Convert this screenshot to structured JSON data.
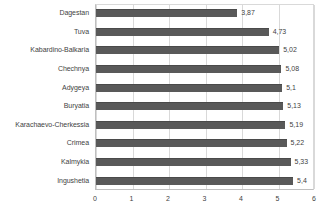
{
  "chart_data": {
    "type": "bar",
    "orientation": "horizontal",
    "title": "",
    "xlabel": "",
    "ylabel": "",
    "xlim": [
      0,
      6
    ],
    "xticks": [
      "0",
      "1",
      "2",
      "3",
      "4",
      "5",
      "6"
    ],
    "grid": true,
    "legend": "none",
    "decimal_separator": ",",
    "bar_color": "#595959",
    "gridline_color": "#d9d9d9",
    "categories": [
      "Dagestan",
      "Tuva",
      "Kabardino-Balkaria",
      "Chechnya",
      "Adygeya",
      "Buryatia",
      "Karachaevo-Cherkessia",
      "Crimea",
      "Kalmykia",
      "Ingushetia"
    ],
    "values": [
      3.87,
      4.73,
      5.02,
      5.08,
      5.1,
      5.13,
      5.19,
      5.22,
      5.33,
      5.4
    ],
    "value_labels": [
      "3,87",
      "4,73",
      "5,02",
      "5,08",
      "5,1",
      "5,13",
      "5,19",
      "5,22",
      "5,33",
      "5,4"
    ]
  }
}
